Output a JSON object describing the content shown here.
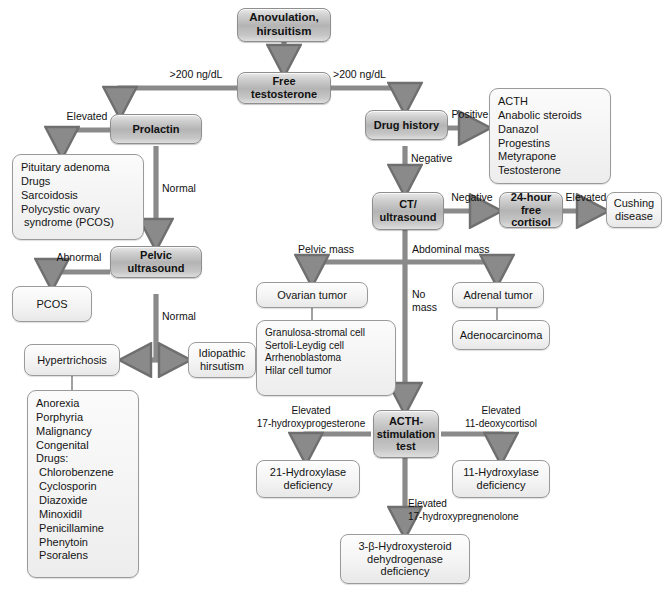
{
  "diagram": {
    "type": "clinical-flowchart"
  },
  "nodes": {
    "anovulation": "Anovulation,\nhirsuitism",
    "free_testosterone": "Free\ntestosterone",
    "prolactin": "Prolactin",
    "prolactin_causes": [
      "Pituitary adenoma",
      "Drugs",
      "Sarcoidosis",
      "Polycystic ovary",
      " syndrome (PCOS)"
    ],
    "pelvic_ultrasound": "Pelvic\nultrasound",
    "pcos": "PCOS",
    "hypertrichosis": "Hypertrichosis",
    "idiopathic_hirsutism": "Idiopathic\nhirsutism",
    "hypertrichosis_causes": [
      "Anorexia",
      "Porphyria",
      "Malignancy",
      "Congenital",
      "Drugs:",
      " Chlorobenzene",
      " Cyclosporin",
      " Diazoxide",
      " Minoxidil",
      " Penicillamine",
      " Phenytoin",
      " Psoralens"
    ],
    "drug_history": "Drug history",
    "drug_list": [
      "ACTH",
      "Anabolic steroids",
      "Danazol",
      "Progestins",
      "Metyrapone",
      "Testosterone"
    ],
    "ct_ultrasound": "CT/\nultrasound",
    "free_cortisol": "24-hour\nfree cortisol",
    "cushing_disease": "Cushing\ndisease",
    "ovarian_tumor": "Ovarian tumor",
    "ovarian_tumor_types": [
      "Granulosa-stromal cell",
      "Sertoli-Leydig cell",
      "Arrhenoblastoma",
      "Hilar cell tumor"
    ],
    "adrenal_tumor": "Adrenal tumor",
    "adenocarcinoma": "Adenocarcinoma",
    "acth_stimulation_test": "ACTH-\nstimulation\ntest",
    "hydroxylase21": "21-Hydroxylase\ndeficiency",
    "hydroxylase11": "11-Hydroxylase\ndeficiency",
    "hydroxysteroid": "3-β-Hydroxysteroid\ndehydrogenase\ndeficiency"
  },
  "edge_labels": {
    "testosterone_left": ">200 ng/dL",
    "testosterone_right": ">200 ng/dL",
    "prolactin_elevated": "Elevated",
    "prolactin_normal": "Normal",
    "pelvic_abnormal": "Abnormal",
    "pelvic_normal": "Normal",
    "drug_positive": "Positive",
    "drug_negative": "Negative",
    "ct_negative": "Negative",
    "cortisol_elevated": "Elevated",
    "pelvic_mass": "Pelvic mass",
    "abdominal_mass": "Abdominal mass",
    "no_mass": "No\nmass",
    "elevated_17ohp": "Elevated\n17-hydroxyprogesterone",
    "elevated_11deoxy": "Elevated\n11-deoxycortisol",
    "elevated_17ohpreg": "Elevated\n17-hydroxypregnenolone"
  },
  "colors": {
    "background": "#ffffff",
    "process_fill": "#b4b4b4",
    "terminal_fill": "#f2f2f2",
    "connector": "#7d7d7d",
    "text": "#141414"
  }
}
